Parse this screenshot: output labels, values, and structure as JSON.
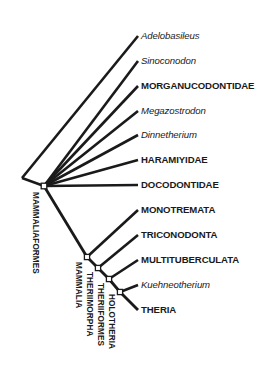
{
  "figure": {
    "type": "cladogram",
    "background_color": "#ffffff",
    "line_color": "#1a1a1a",
    "node_fill_color": "#ffffff",
    "width": 257,
    "height": 378
  },
  "taxa": [
    {
      "label": "Adelobasileus",
      "style": "genus",
      "tip_x": 138,
      "tip_y": 36,
      "label_x": 141,
      "label_y": 36
    },
    {
      "label": "Sinoconodon",
      "style": "genus",
      "tip_x": 138,
      "tip_y": 61,
      "label_x": 141,
      "label_y": 61
    },
    {
      "label": "MORGANUCODONTIDAE",
      "style": "family",
      "tip_x": 138,
      "tip_y": 86,
      "label_x": 141,
      "label_y": 86
    },
    {
      "label": "Megazostrodon",
      "style": "genus",
      "tip_x": 138,
      "tip_y": 111,
      "label_x": 141,
      "label_y": 111
    },
    {
      "label": "Dinnetherium",
      "style": "genus",
      "tip_x": 138,
      "tip_y": 135,
      "label_x": 141,
      "label_y": 135
    },
    {
      "label": "HARAMIYIDAE",
      "style": "family",
      "tip_x": 138,
      "tip_y": 160,
      "label_x": 141,
      "label_y": 160
    },
    {
      "label": "DOCODONTIDAE",
      "style": "family",
      "tip_x": 138,
      "tip_y": 185,
      "label_x": 141,
      "label_y": 185
    },
    {
      "label": "MONOTREMATA",
      "style": "family",
      "tip_x": 138,
      "tip_y": 210,
      "label_x": 141,
      "label_y": 210
    },
    {
      "label": "TRICONODONTA",
      "style": "family",
      "tip_x": 138,
      "tip_y": 235,
      "label_x": 141,
      "label_y": 235
    },
    {
      "label": "MULTITUBERCULATA",
      "style": "family",
      "tip_x": 138,
      "tip_y": 260,
      "label_x": 141,
      "label_y": 260
    },
    {
      "label": "Kuehneotherium",
      "style": "genus",
      "tip_x": 138,
      "tip_y": 285,
      "label_x": 141,
      "label_y": 285
    },
    {
      "label": "THERIA",
      "style": "family",
      "tip_x": 138,
      "tip_y": 310,
      "label_x": 141,
      "label_y": 310
    }
  ],
  "clades": [
    {
      "label": "MAMMALIAFORMES",
      "x": 40,
      "y": 192
    },
    {
      "label": "MAMMALIA",
      "x": 83,
      "y": 262
    },
    {
      "label": "THERIIMORPHA",
      "x": 94,
      "y": 272
    },
    {
      "label": "THERIIFORMES",
      "x": 105,
      "y": 283
    },
    {
      "label": "HOLOTHERIA",
      "x": 116,
      "y": 294
    }
  ],
  "nodes": [
    {
      "name": "root-node",
      "x": 44,
      "y": 186
    },
    {
      "name": "mammalia-node",
      "x": 87,
      "y": 257
    },
    {
      "name": "theriimorpha-node",
      "x": 98,
      "y": 268
    },
    {
      "name": "theriiformes-node",
      "x": 109,
      "y": 279
    },
    {
      "name": "holotheria-node",
      "x": 120,
      "y": 292
    }
  ],
  "branches": {
    "stem_start": {
      "x": 22,
      "y": 178
    },
    "fan_from": {
      "x": 44,
      "y": 186
    }
  }
}
